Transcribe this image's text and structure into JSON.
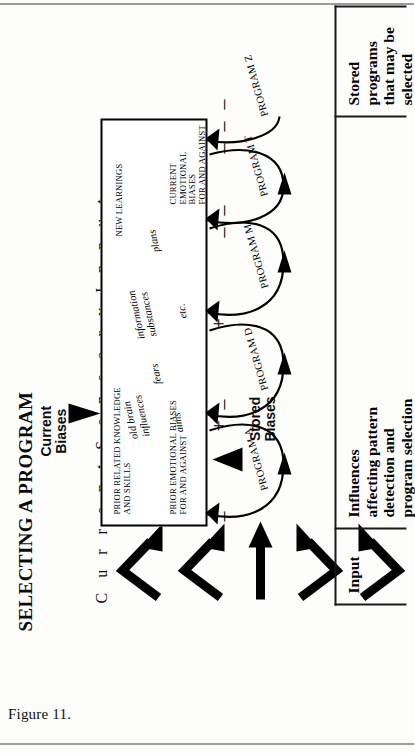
{
  "page": {
    "caption": "Figure 11."
  },
  "figure": {
    "title": "SELECTING A PROGRAM",
    "sensory_input_label": "C u r r e n t   S e n s o r y   I n p u t",
    "current_biases_label": "Current\nBiases",
    "stored_biases_label": "Stored\nBiases",
    "input_arrow_count": 5
  },
  "main_box": {
    "top_caps_left": "NEW LEARNINGS",
    "top_italic": "plans",
    "top_caps_right": "CURRENT\nEMOTIONAL BIASES\nFOR AND AGAINST",
    "mid_italic_1": "etc.",
    "mid_italic_2": "information\nsubstances",
    "low_italic_1": "fears",
    "low_italic_2": "old brain\ninfluences",
    "bottom_caps_left": "PRIOR RELATED KNOWLEDGE\nAND SKILLS",
    "bottom_italic": "aims",
    "bottom_caps_right": "PRIOR EMOTIONAL BIASES\nFOR AND AGAINST"
  },
  "programs": [
    {
      "label": "PROGRAM A",
      "signs_after": [
        "+",
        "–"
      ]
    },
    {
      "label": "PROGRAM D",
      "signs_after": [
        "+"
      ]
    },
    {
      "label": "PROGRAM M",
      "signs_after": [
        "–",
        "–"
      ]
    },
    {
      "label": "PROGRAM T",
      "signs_after": [
        "–",
        "–",
        "–"
      ]
    },
    {
      "label": "PROGRAM Z",
      "signs_after": []
    }
  ],
  "program_edge_signs": {
    "below_program_a": "–"
  },
  "zones": [
    {
      "label": "Input"
    },
    {
      "label": "Influences\naffecting pattern\ndetection and\nprogram selection"
    },
    {
      "label": "Stored programs\nthat may be\nselected"
    }
  ],
  "colors": {
    "ink": "#000000",
    "paper": "#fdfdfc",
    "rule": "#9b9b9b"
  }
}
